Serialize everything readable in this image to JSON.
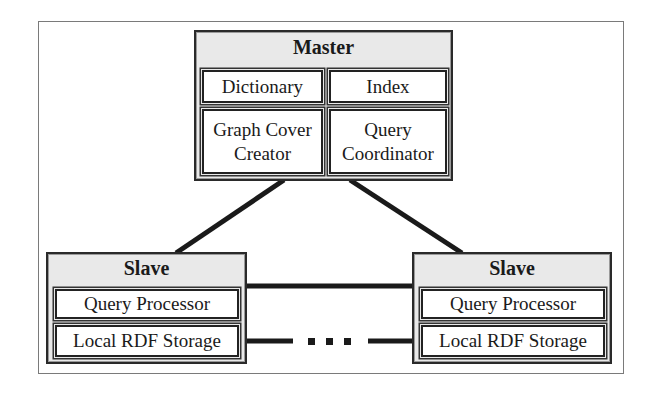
{
  "diagram": {
    "master": {
      "title": "Master",
      "components": {
        "dictionary": "Dictionary",
        "index": "Index",
        "graph_cover_creator_line1": "Graph Cover",
        "graph_cover_creator_line2": "Creator",
        "query_coordinator_line1": "Query",
        "query_coordinator_line2": "Coordinator"
      }
    },
    "slave_left": {
      "title": "Slave",
      "components": {
        "query_processor": "Query Processor",
        "local_rdf_storage": "Local RDF Storage"
      }
    },
    "slave_right": {
      "title": "Slave",
      "components": {
        "query_processor": "Query Processor",
        "local_rdf_storage": "Local RDF Storage"
      }
    },
    "connections": [
      {
        "from": "master",
        "to": "slave_left",
        "style": "solid"
      },
      {
        "from": "master",
        "to": "slave_right",
        "style": "solid"
      },
      {
        "from": "slave_left",
        "to": "slave_right",
        "style": "solid"
      },
      {
        "from": "slave_left",
        "to": "slave_right",
        "style": "ellipsis"
      }
    ],
    "colors": {
      "node_fill": "#e9e9e9",
      "component_fill": "#ffffff",
      "stroke": "#1a1a1a"
    }
  }
}
